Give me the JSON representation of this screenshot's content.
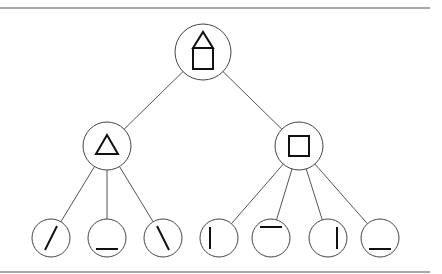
{
  "diagram": {
    "type": "tree",
    "colors": {
      "rule": "#8a8a8a",
      "edge": "#555555",
      "node_stroke": "#444444",
      "glyph": "#111111",
      "background": "#ffffff"
    },
    "rules": [
      {
        "name": "top-rule",
        "x1": 0,
        "y1": 8,
        "x2": 430,
        "y2": 8
      },
      {
        "name": "bottom-rule",
        "x1": 0,
        "y1": 272,
        "x2": 430,
        "y2": 272
      }
    ],
    "nodes": [
      {
        "id": "root",
        "level": 0,
        "shape": "house",
        "cx": 203,
        "cy": 52,
        "r": 28
      },
      {
        "id": "triangle",
        "level": 1,
        "parent": "root",
        "shape": "triangle",
        "cx": 107,
        "cy": 146,
        "r": 24
      },
      {
        "id": "square",
        "level": 1,
        "parent": "root",
        "shape": "square",
        "cx": 299,
        "cy": 146,
        "r": 24
      },
      {
        "id": "tri-left-side",
        "level": 2,
        "parent": "triangle",
        "shape": "forward-slash-line",
        "cx": 51,
        "cy": 238,
        "r": 19
      },
      {
        "id": "tri-base",
        "level": 2,
        "parent": "triangle",
        "shape": "bottom-horizontal-line",
        "cx": 107,
        "cy": 238,
        "r": 19
      },
      {
        "id": "tri-right-side",
        "level": 2,
        "parent": "triangle",
        "shape": "back-slash-line",
        "cx": 163,
        "cy": 238,
        "r": 19
      },
      {
        "id": "sq-left-side",
        "level": 2,
        "parent": "square",
        "shape": "left-vertical-line",
        "cx": 219,
        "cy": 238,
        "r": 19
      },
      {
        "id": "sq-top-side",
        "level": 2,
        "parent": "square",
        "shape": "top-horizontal-line",
        "cx": 271,
        "cy": 238,
        "r": 19
      },
      {
        "id": "sq-right-side",
        "level": 2,
        "parent": "square",
        "shape": "right-vertical-line",
        "cx": 328,
        "cy": 238,
        "r": 19
      },
      {
        "id": "sq-bottom-side",
        "level": 2,
        "parent": "square",
        "shape": "bottom-horizontal-line",
        "cx": 380,
        "cy": 238,
        "r": 19
      }
    ],
    "edges": [
      {
        "from": "root",
        "to": "triangle"
      },
      {
        "from": "root",
        "to": "square"
      },
      {
        "from": "triangle",
        "to": "tri-left-side"
      },
      {
        "from": "triangle",
        "to": "tri-base"
      },
      {
        "from": "triangle",
        "to": "tri-right-side"
      },
      {
        "from": "square",
        "to": "sq-left-side"
      },
      {
        "from": "square",
        "to": "sq-top-side"
      },
      {
        "from": "square",
        "to": "sq-right-side"
      },
      {
        "from": "square",
        "to": "sq-bottom-side"
      }
    ]
  }
}
